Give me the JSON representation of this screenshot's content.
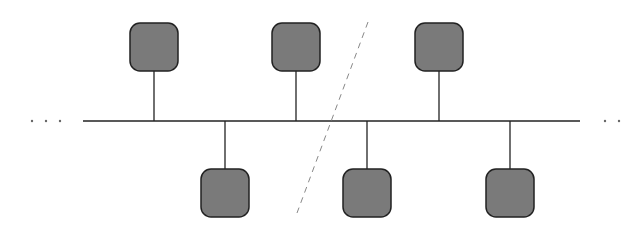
{
  "diagram": {
    "type": "bus-topology",
    "colors": {
      "background": "#ffffff",
      "bus": "#222222",
      "node_fill": "#7a7a7a",
      "node_stroke": "#222222",
      "break_line": "#888888",
      "dots": "#666666"
    },
    "bus": {
      "x1": 83,
      "x2": 580,
      "y": 121
    },
    "left_ellipsis": [
      32,
      46,
      60
    ],
    "right_ellipsis": [
      605,
      619
    ],
    "top_nodes": [
      {
        "id": "node-top-1",
        "cx": 154
      },
      {
        "id": "node-top-2",
        "cx": 296
      },
      {
        "id": "node-top-3",
        "cx": 439
      }
    ],
    "bottom_nodes": [
      {
        "id": "node-bottom-1",
        "cx": 225
      },
      {
        "id": "node-bottom-2",
        "cx": 367
      },
      {
        "id": "node-bottom-3",
        "cx": 510
      }
    ],
    "break_line": {
      "x1": 368,
      "y1": 22,
      "x2": 297,
      "y2": 213
    }
  }
}
